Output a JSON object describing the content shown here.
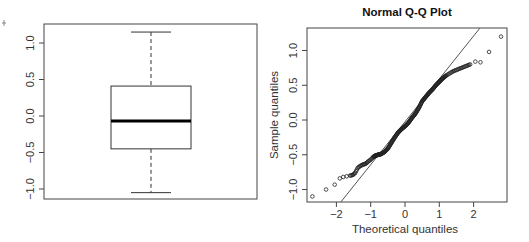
{
  "chart_data": [
    {
      "type": "box",
      "title": "",
      "xlabel": "",
      "ylabel": "",
      "ylim": [
        -1.1,
        1.25
      ],
      "yticks": [
        "-1.0",
        "-0.5",
        "0.0",
        "0.5",
        "1.0"
      ],
      "stats": {
        "upper_whisker": 1.15,
        "q3": 0.41,
        "median": -0.07,
        "q1": -0.45,
        "lower_whisker": -1.05
      },
      "grid": false
    },
    {
      "type": "scatter",
      "title": "Normal Q-Q Plot",
      "xlabel": "Theoretical quantiles",
      "ylabel": "Sample quantiles",
      "xticks": [
        "-2",
        "-1",
        "0",
        "1",
        "2"
      ],
      "yticks": [
        "-1.0",
        "-0.5",
        "0.0",
        "0.5",
        "1.0"
      ],
      "xlim": [
        -2.85,
        2.95
      ],
      "ylim": [
        -1.18,
        1.32
      ],
      "reference_line": {
        "x0": -1.87,
        "y0": -1.18,
        "x1": 2.18,
        "y1": 1.32
      },
      "points": [
        [
          -2.7,
          -1.1
        ],
        [
          -2.3,
          -1.0
        ],
        [
          -2.05,
          -0.93
        ],
        [
          -1.9,
          -0.84
        ],
        [
          -1.8,
          -0.82
        ],
        [
          -1.7,
          -0.81
        ],
        [
          -1.6,
          -0.8
        ],
        [
          -1.52,
          -0.79
        ],
        [
          -1.45,
          -0.76
        ],
        [
          -1.38,
          -0.69
        ],
        [
          -1.3,
          -0.66
        ],
        [
          -1.22,
          -0.64
        ],
        [
          -1.15,
          -0.63
        ],
        [
          -1.08,
          -0.6
        ],
        [
          -1.0,
          -0.57
        ],
        [
          -0.92,
          -0.53
        ],
        [
          -0.85,
          -0.51
        ],
        [
          -0.78,
          -0.5
        ],
        [
          -0.7,
          -0.49
        ],
        [
          -0.6,
          -0.46
        ],
        [
          -0.5,
          -0.41
        ],
        [
          -0.4,
          -0.33
        ],
        [
          -0.3,
          -0.25
        ],
        [
          -0.2,
          -0.18
        ],
        [
          -0.1,
          -0.13
        ],
        [
          0.0,
          -0.09
        ],
        [
          0.1,
          -0.04
        ],
        [
          0.2,
          0.03
        ],
        [
          0.3,
          0.09
        ],
        [
          0.4,
          0.17
        ],
        [
          0.5,
          0.27
        ],
        [
          0.6,
          0.33
        ],
        [
          0.7,
          0.39
        ],
        [
          0.8,
          0.44
        ],
        [
          0.9,
          0.5
        ],
        [
          1.0,
          0.55
        ],
        [
          1.1,
          0.6
        ],
        [
          1.2,
          0.64
        ],
        [
          1.3,
          0.67
        ],
        [
          1.4,
          0.7
        ],
        [
          1.5,
          0.72
        ],
        [
          1.6,
          0.74
        ],
        [
          1.7,
          0.76
        ],
        [
          1.8,
          0.78
        ],
        [
          1.9,
          0.8
        ],
        [
          2.05,
          0.84
        ],
        [
          2.2,
          0.83
        ],
        [
          2.45,
          0.98
        ],
        [
          2.8,
          1.2
        ]
      ],
      "grid": false
    }
  ],
  "labels": {
    "qq_title": "Normal Q-Q Plot",
    "qq_xlabel": "Theoretical quantiles",
    "qq_ylabel": "Sample quantiles"
  }
}
